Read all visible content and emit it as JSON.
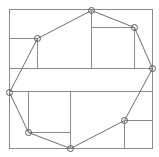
{
  "diagram": {
    "title": "",
    "width": 159,
    "height": 157,
    "colors": {
      "background": "#ffffff",
      "frame": "#8a8a8a",
      "grid": "#8a8a8a",
      "hull": "#6f6f6f",
      "vertex": "#5a5a5a"
    },
    "frame": {
      "x": 9,
      "y": 9,
      "width": 143,
      "height": 139
    },
    "vertex_radius": 3,
    "vertices": [
      {
        "id": "v1",
        "x": 37,
        "y": 38
      },
      {
        "id": "v2",
        "x": 91,
        "y": 10
      },
      {
        "id": "v3",
        "x": 134,
        "y": 27
      },
      {
        "id": "v4",
        "x": 152,
        "y": 68
      },
      {
        "id": "v5",
        "x": 124,
        "y": 120
      },
      {
        "id": "v6",
        "x": 70,
        "y": 148
      },
      {
        "id": "v7",
        "x": 28,
        "y": 132
      },
      {
        "id": "v8",
        "x": 9,
        "y": 92
      }
    ],
    "partition_lines": [
      {
        "id": "h-upperleft",
        "x1": 9,
        "y1": 38,
        "x2": 37,
        "y2": 38
      },
      {
        "id": "v-upperleft",
        "x1": 37,
        "y1": 38,
        "x2": 37,
        "y2": 68
      },
      {
        "id": "v-topmid",
        "x1": 91,
        "y1": 10,
        "x2": 91,
        "y2": 68
      },
      {
        "id": "h-upperright",
        "x1": 91,
        "y1": 27,
        "x2": 134,
        "y2": 27
      },
      {
        "id": "v-upperright",
        "x1": 134,
        "y1": 27,
        "x2": 134,
        "y2": 68
      },
      {
        "id": "h-band-top",
        "x1": 9,
        "y1": 68,
        "x2": 152,
        "y2": 68
      },
      {
        "id": "h-band-bottom",
        "x1": 9,
        "y1": 91,
        "x2": 152,
        "y2": 91
      },
      {
        "id": "v-lowerleft",
        "x1": 28,
        "y1": 91,
        "x2": 28,
        "y2": 132
      },
      {
        "id": "h-lowerleft",
        "x1": 28,
        "y1": 132,
        "x2": 70,
        "y2": 132
      },
      {
        "id": "v-lowermid",
        "x1": 70,
        "y1": 91,
        "x2": 70,
        "y2": 148
      },
      {
        "id": "h-lowerright",
        "x1": 124,
        "y1": 120,
        "x2": 152,
        "y2": 120
      },
      {
        "id": "v-lowerright",
        "x1": 124,
        "y1": 120,
        "x2": 124,
        "y2": 148
      }
    ]
  }
}
